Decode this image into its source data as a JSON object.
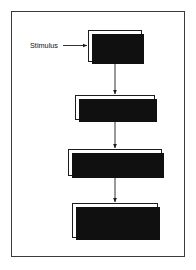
{
  "figure": {
    "type": "flowchart",
    "orientation": "vertical top-to-bottom",
    "frame": {
      "border_color": "#3a3a3a",
      "background": "#ffffff"
    },
    "style": {
      "node_border_color": "#1c1c1c",
      "node_fill": "#ffffff",
      "shadow_color": "#101010",
      "text_color": "#111111",
      "connector_color": "#1c1c1c"
    }
  },
  "labels": {
    "stimulus": "Stimulus"
  },
  "nodes": [
    {
      "id": "cortex",
      "lines": [
        "CORTEX",
        "Perception"
      ],
      "line1": "CORTEX",
      "line2": "Perception"
    },
    {
      "id": "thalamus",
      "lines": [
        "Thalamus",
        "(emotional feeling)"
      ],
      "line1": "Thalamus",
      "line2": "(emotional feeling)"
    },
    {
      "id": "hypothalamus",
      "lines": [
        "Hypothalamus",
        "(emotional expression)"
      ],
      "line1": "Hypothalamus",
      "line2": "(emotional expression)"
    },
    {
      "id": "peripheral",
      "lines": [
        "Peripheral arousal",
        "+",
        "Muscle activity"
      ],
      "line1": "Peripheral arousal",
      "line2": "+",
      "line3": "Muscle activity"
    }
  ],
  "connectors": [
    {
      "id": "stimulus-to-cortex",
      "from": "Stimulus",
      "to": "CORTEX Perception",
      "direction": "right"
    },
    {
      "id": "cortex-to-thalamus",
      "from": "CORTEX Perception",
      "to": "Thalamus",
      "direction": "down"
    },
    {
      "id": "thalamus-to-hypothalamus",
      "from": "Thalamus",
      "to": "Hypothalamus",
      "direction": "down"
    },
    {
      "id": "hypothalamus-to-peripheral",
      "from": "Hypothalamus",
      "to": "Peripheral arousal",
      "direction": "down"
    }
  ]
}
